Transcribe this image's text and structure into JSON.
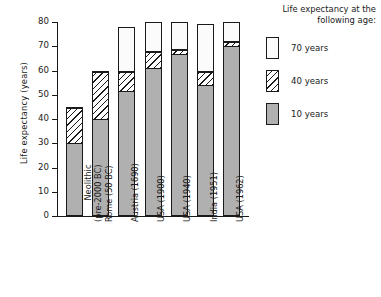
{
  "chart_data": {
    "type": "bar",
    "stacked": true,
    "title": "",
    "xlabel": "",
    "ylabel": "Life expectancy (years)",
    "ylim": [
      0,
      80
    ],
    "yticks": [
      0,
      10,
      20,
      30,
      40,
      50,
      60,
      70,
      80
    ],
    "grid": false,
    "legend_position": "right",
    "legend_title": "Life expectancy at the following age:",
    "categories": [
      "Neolithic (pre-2000 BC)",
      "Rome (50 BC)",
      "Austria (1690)",
      "USA (1900)",
      "USA (1940)",
      "India (1951)",
      "USA (1962)"
    ],
    "category_lines": [
      [
        "Neolithic",
        "(pre-2000 BC)"
      ],
      [
        "Rome (50 BC)",
        ""
      ],
      [
        "Austria (1690)",
        ""
      ],
      [
        "USA (1900)",
        ""
      ],
      [
        "USA (1940)",
        ""
      ],
      [
        "India (1951)",
        ""
      ],
      [
        "USA (1962)",
        ""
      ]
    ],
    "series": [
      {
        "name": "10 years",
        "pattern": "solid-grey",
        "values": [
          30,
          40,
          51.5,
          61,
          67,
          54,
          70
        ]
      },
      {
        "name": "40 years",
        "pattern": "diagonal-hatch",
        "values": [
          45,
          60,
          60,
          68,
          69,
          60,
          72
        ]
      },
      {
        "name": "70 years",
        "pattern": "dotted",
        "values": [
          45,
          60,
          78,
          80,
          80,
          79,
          80
        ]
      }
    ]
  },
  "legend": {
    "title_line1": "Life expectancy at the",
    "title_line2": "following age:",
    "items": [
      {
        "label": "70 years",
        "pattern": "dotted"
      },
      {
        "label": "40 years",
        "pattern": "diagonal-hatch"
      },
      {
        "label": "10 years",
        "pattern": "solid-grey"
      }
    ]
  },
  "colors": {
    "axis": "#1a1a1a",
    "bar_grey": "#b0b0b0",
    "background": "#ffffff"
  }
}
